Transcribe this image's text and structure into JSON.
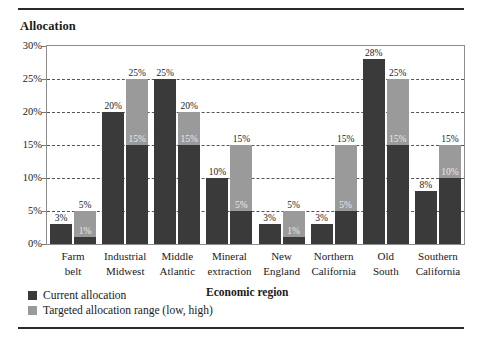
{
  "figure": {
    "title": "Allocation",
    "xaxis_title": "Economic region",
    "rule_color": "#2a2a2a"
  },
  "colors": {
    "current": "#3a3a3a",
    "target": "#9a9a9a",
    "grid": "#555555",
    "frame": "#8d8d8d",
    "text": "#1a1a1a",
    "label_inside": "#e8e8e8"
  },
  "legend": {
    "items": [
      {
        "label": "Current allocation",
        "color": "#3a3a3a",
        "swatch": "current-swatch"
      },
      {
        "label": "Targeted allocation range (low, high)",
        "color": "#9a9a9a",
        "swatch": "target-swatch"
      }
    ]
  },
  "chart_data": {
    "type": "bar",
    "title": "Allocation",
    "xlabel": "Economic region",
    "ylabel": "",
    "ylim": [
      0,
      30
    ],
    "yticks": [
      0,
      5,
      10,
      15,
      20,
      25,
      30
    ],
    "ytick_labels": [
      "0%",
      "5%",
      "10%",
      "15%",
      "20%",
      "25%",
      "30%"
    ],
    "grid": true,
    "grid_axis": "y",
    "legend_position": "below-left",
    "categories": [
      "Farm belt",
      "Industrial Midwest",
      "Middle Atlantic",
      "Mineral extraction",
      "New England",
      "Northern California",
      "Old South",
      "Southern California"
    ],
    "category_lines": [
      [
        "Farm",
        "belt"
      ],
      [
        "Industrial",
        "Midwest"
      ],
      [
        "Middle",
        "Atlantic"
      ],
      [
        "Mineral",
        "extraction"
      ],
      [
        "New",
        "England"
      ],
      [
        "Northern",
        "California"
      ],
      [
        "Old",
        "South"
      ],
      [
        "Southern",
        "California"
      ]
    ],
    "series": [
      {
        "name": "Current allocation",
        "values": [
          3,
          20,
          25,
          10,
          3,
          3,
          28,
          8
        ],
        "labels": [
          "3%",
          "20%",
          "25%",
          "10%",
          "3%",
          "3%",
          "28%",
          "8%"
        ]
      },
      {
        "name": "Targeted allocation range (low, high)",
        "low": [
          1,
          15,
          15,
          5,
          1,
          5,
          15,
          10
        ],
        "high": [
          5,
          25,
          20,
          15,
          5,
          15,
          25,
          15
        ],
        "low_labels": [
          "1%",
          "15%",
          "15%",
          "5%",
          "1%",
          "5%",
          "15%",
          "10%"
        ],
        "high_labels": [
          "5%",
          "25%",
          "20%",
          "15%",
          "5%",
          "15%",
          "25%",
          "15%"
        ]
      }
    ]
  }
}
